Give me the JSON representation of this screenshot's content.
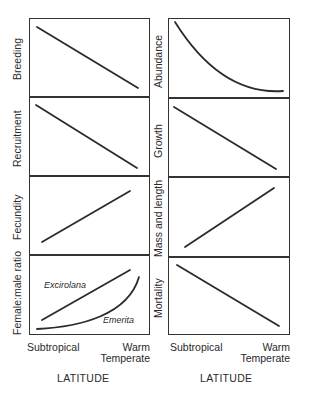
{
  "figure": {
    "left_column": {
      "panels": [
        {
          "ylabel": "Breeding",
          "trend": "decreasing"
        },
        {
          "ylabel": "Recruitment",
          "trend": "decreasing"
        },
        {
          "ylabel": "Fecundity",
          "trend": "increasing"
        },
        {
          "ylabel": "Female:male ratio",
          "trend": "increasing",
          "series": [
            {
              "name": "Excirolana",
              "shape": "linear increasing"
            },
            {
              "name": "Emerita",
              "shape": "exponential increasing"
            }
          ]
        }
      ],
      "xticks": {
        "left": "Subtropical",
        "right_line1": "Warm",
        "right_line2": "Temperate"
      },
      "xlabel": "LATITUDE"
    },
    "right_column": {
      "panels": [
        {
          "ylabel": "Abundance",
          "trend": "decreasing (concave curve)"
        },
        {
          "ylabel": "Growth",
          "trend": "decreasing"
        },
        {
          "ylabel": "Mass and length",
          "trend": "increasing"
        },
        {
          "ylabel": "Mortality",
          "trend": "decreasing"
        }
      ],
      "xticks": {
        "left": "Subtropical",
        "right_line1": "Warm",
        "right_line2": "Temperate"
      },
      "xlabel": "LATITUDE"
    },
    "line_color": "#2b2b2b"
  }
}
